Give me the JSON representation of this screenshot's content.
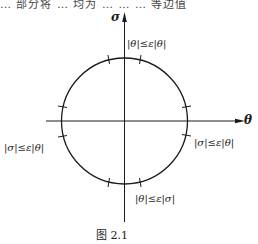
{
  "header": {
    "partial_text": "… 部分将 … 均为 …  …  … 等边值"
  },
  "figure": {
    "axes": {
      "vertical_label": "σ",
      "horizontal_label": "θ"
    },
    "regions": {
      "top": "|θ|≤ε|θ|",
      "right": "|σ|≤ε|θ|",
      "bottom": "|θ|≤ε|σ|",
      "left": "|σ|≤ε|θ|"
    },
    "caption": "图   2.1",
    "circle": {
      "cx": 124.5,
      "cy": 121,
      "r": 63
    },
    "colors": {
      "ink": "#1a1a1a",
      "background": "#ffffff"
    }
  }
}
